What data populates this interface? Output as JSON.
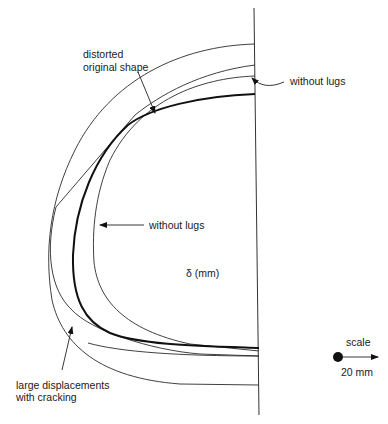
{
  "diagram": {
    "type": "deformed-shape-comparison",
    "labels": {
      "distorted_line1": "distorted",
      "distorted_line2": "original shape",
      "without_lugs_top": "without lugs",
      "without_lugs_mid": "without lugs",
      "delta": "δ (mm)",
      "large_disp_line1": "large displacements",
      "large_disp_line2": "with cracking",
      "scale_label": "scale",
      "scale_value": "20 mm"
    },
    "curves": [
      {
        "name": "large displacements with cracking",
        "style": "thin",
        "top_y": 44,
        "bottom_y": 385,
        "leftmost_x": 49
      },
      {
        "name": "distorted original shape",
        "style": "thin",
        "top_y": 65,
        "bottom_y": 356
      },
      {
        "name": "without lugs",
        "style": "thin",
        "top_y": 76,
        "leftmost_x": 93
      },
      {
        "name": "original shape (bold)",
        "style": "thick",
        "top_y": 94,
        "bottom_y": 348,
        "leftmost_x": 73
      }
    ],
    "symmetry_axis": {
      "x_top": 254,
      "y_top": 8,
      "x_bottom": 259,
      "y_bottom": 415
    },
    "colors": {
      "line": "#222222",
      "background": "#ffffff"
    }
  }
}
